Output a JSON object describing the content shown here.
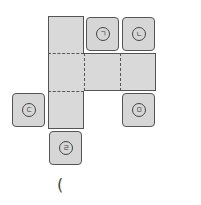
{
  "diagram": {
    "type": "cube-net",
    "net_squares": [
      {
        "row": 0,
        "col": 0
      },
      {
        "row": 1,
        "col": 0
      },
      {
        "row": 1,
        "col": 1
      },
      {
        "row": 1,
        "col": 2
      },
      {
        "row": 2,
        "col": 0
      }
    ],
    "candidate_tiles": [
      {
        "id": "giyeok",
        "label": "ㄱ",
        "position": "right of top square"
      },
      {
        "id": "nieun",
        "label": "ㄴ",
        "position": "above right end of middle row"
      },
      {
        "id": "digeut",
        "label": "ㄷ",
        "position": "left of bottom square"
      },
      {
        "id": "rieul",
        "label": "ㄹ",
        "position": "below bottom square"
      },
      {
        "id": "mieum",
        "label": "ㅁ",
        "position": "below right end of middle row"
      }
    ],
    "answer_paren": "("
  }
}
